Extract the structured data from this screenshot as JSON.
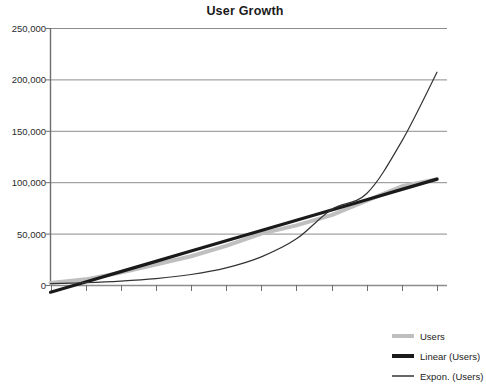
{
  "chart": {
    "title": "User Growth"
  },
  "legend": {
    "position": "bottom-right",
    "items": [
      {
        "label": "Users",
        "color": "#bfbfbf",
        "style": "thick-line",
        "icon": "line-swatch-icon"
      },
      {
        "label": "Linear (Users)",
        "color": "#1a1a1a",
        "style": "thick-line",
        "icon": "line-swatch-icon"
      },
      {
        "label": "Expon. (Users)",
        "color": "#333333",
        "style": "thin-line",
        "icon": "line-swatch-icon"
      }
    ]
  },
  "axis": {
    "y_ticks": [
      "0",
      "50,000",
      "100,000",
      "150,000",
      "200,000",
      "250,000"
    ],
    "x_tick_count": 12
  },
  "colors": {
    "users_series": "#bfbfbf",
    "linear_trend": "#1a1a1a",
    "expon_trend": "#333333",
    "gridline": "#8c8c8c",
    "axis": "#6e6e6e",
    "title": "#1a1a1a",
    "background": "#ffffff"
  },
  "chart_data": {
    "type": "line",
    "title": "User Growth",
    "xlabel": "",
    "ylabel": "",
    "ylim": [
      0,
      250000
    ],
    "yticks": [
      0,
      50000,
      100000,
      150000,
      200000,
      250000
    ],
    "grid": true,
    "legend_position": "bottom-right",
    "x": [
      1,
      2,
      3,
      4,
      5,
      6,
      7,
      8,
      9,
      10,
      11,
      12
    ],
    "series": [
      {
        "name": "Users",
        "type": "line",
        "color": "#bfbfbf",
        "values": [
          2000,
          5500,
          12000,
          20000,
          28000,
          38000,
          50000,
          58000,
          68000,
          82000,
          96000,
          103000
        ]
      },
      {
        "name": "Linear (Users)",
        "type": "trendline",
        "color": "#1a1a1a",
        "values": [
          -7000,
          3000,
          13000,
          23000,
          33000,
          43000,
          53000,
          63000,
          73000,
          83000,
          93000,
          103000
        ]
      },
      {
        "name": "Expon. (Users)",
        "type": "trendline",
        "color": "#333333",
        "values": [
          1400,
          2300,
          3800,
          6200,
          10200,
          16700,
          27400,
          44900,
          73500,
          89000,
          140000,
          207000
        ]
      }
    ]
  }
}
